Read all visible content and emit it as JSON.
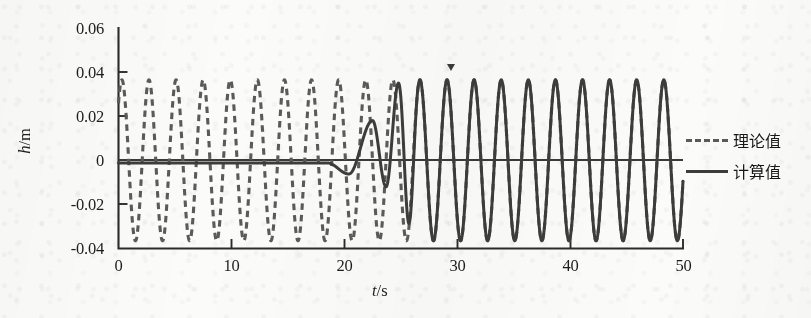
{
  "figure": {
    "background_color": "#fbfbf9",
    "line_color_theoretical": "#5a5a5a",
    "line_color_computed": "#3c3c3c",
    "axis_color": "#2b2b2b"
  },
  "axes": {
    "x_title": "t/s",
    "x_title_var": "t",
    "x_title_unit": "/s",
    "y_title": "h/m",
    "y_title_var": "h",
    "y_title_unit": "/m",
    "x_ticks": [
      "0",
      "10",
      "20",
      "30",
      "40",
      "50"
    ],
    "y_ticks": [
      "0.06",
      "0.04",
      "0.02",
      "0",
      "-0.02",
      "-0.04"
    ]
  },
  "legend": {
    "position": "right",
    "items": [
      {
        "label": "理论值",
        "style": "dashed"
      },
      {
        "label": "计算值",
        "style": "solid"
      }
    ]
  },
  "chart_data": {
    "type": "line",
    "title": "",
    "xlabel": "t/s",
    "ylabel": "h/m",
    "xlim": [
      0,
      50
    ],
    "ylim": [
      -0.04,
      0.06
    ],
    "x_ticks": [
      0,
      10,
      20,
      30,
      40,
      50
    ],
    "y_ticks": [
      -0.04,
      -0.02,
      0,
      0.02,
      0.04,
      0.06
    ],
    "grid": false,
    "legend_position": "right",
    "series": [
      {
        "name": "理论值",
        "style": "dashed",
        "color": "#5a5a5a",
        "model": "sine",
        "amplitude": 0.0365,
        "period": 2.4,
        "phase_deg": 45,
        "offset": 0.0,
        "x_start": 0,
        "x_end": 50,
        "x_samples": [
          0,
          0.3,
          0.6,
          1.2,
          1.8,
          2.4,
          3.0,
          3.6,
          4.2,
          4.8,
          6.0,
          7.2,
          8.4,
          9.6,
          12.0,
          15.0,
          18.0,
          21.0,
          24.0,
          27.0,
          30.0,
          33.0,
          36.0,
          40.0,
          44.0,
          48.0,
          50.0
        ],
        "y_samples": [
          0.0258,
          0.0345,
          0.0365,
          0.0258,
          0.0,
          -0.0258,
          -0.0365,
          -0.0258,
          0.0,
          0.0258,
          0.0258,
          0.0258,
          0.0258,
          0.0258,
          0.0258,
          -0.0258,
          0.0258,
          -0.0258,
          0.0258,
          -0.0258,
          0.0258,
          -0.0258,
          0.0258,
          0.0,
          -0.0258,
          0.0258,
          0.0258
        ]
      },
      {
        "name": "计算值",
        "style": "solid",
        "color": "#3c3c3c",
        "model": "transient-then-locked",
        "quiet_value": -0.0012,
        "quiet_until_t": 18.5,
        "dip_t": 20.4,
        "dip_value": -0.0062,
        "first_peak_t": 22.5,
        "first_peak_value": 0.018,
        "second_trough_t": 23.7,
        "second_trough_value": -0.012,
        "second_peak_t": 24.8,
        "second_peak_value": 0.035,
        "locked_from_t": 26.5,
        "locked_amplitude": 0.0365,
        "end_value": -0.033
      }
    ]
  },
  "annotations": [
    {
      "name": "tick-marker-arrow",
      "x": 29.2,
      "y": 0.0595
    }
  ]
}
